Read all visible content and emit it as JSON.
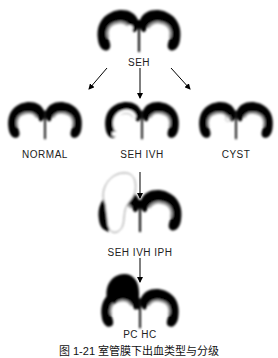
{
  "diagram": {
    "nodes": [
      {
        "id": "seh",
        "label": "SEH"
      },
      {
        "id": "normal",
        "label": "NORMAL"
      },
      {
        "id": "seh_ivh",
        "label": "SEH IVH"
      },
      {
        "id": "cyst",
        "label": "CYST"
      },
      {
        "id": "seh_ivh_iph",
        "label": "SEH IVH IPH"
      },
      {
        "id": "pc_hc",
        "label": "PC HC"
      }
    ],
    "edges": [
      {
        "from": "seh",
        "to": "normal"
      },
      {
        "from": "seh",
        "to": "seh_ivh"
      },
      {
        "from": "seh",
        "to": "cyst"
      },
      {
        "from": "seh_ivh",
        "to": "seh_ivh_iph"
      },
      {
        "from": "seh_ivh_iph",
        "to": "pc_hc"
      }
    ],
    "caption": "图 1-21  室管膜下出血类型与分级"
  }
}
